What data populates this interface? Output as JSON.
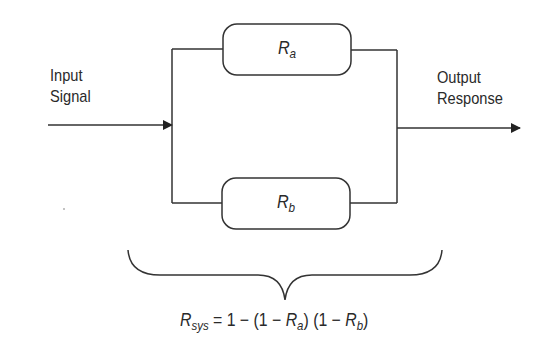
{
  "diagram": {
    "input_label": {
      "line1": "Input",
      "line2": "Signal"
    },
    "output_label": {
      "line1": "Output",
      "line2": "Response"
    },
    "block_a": {
      "symbol": "R",
      "subscript": "a"
    },
    "block_b": {
      "symbol": "R",
      "subscript": "b"
    },
    "formula": {
      "lhs_symbol": "R",
      "lhs_subscript": "sys",
      "eq": " = 1 − (1 − ",
      "ra_symbol": "R",
      "ra_subscript": "a",
      "mid": ") (1 − ",
      "rb_symbol": "R",
      "rb_subscript": "b",
      "end": ")"
    },
    "colors": {
      "line": "#333333",
      "background": "#ffffff"
    }
  }
}
